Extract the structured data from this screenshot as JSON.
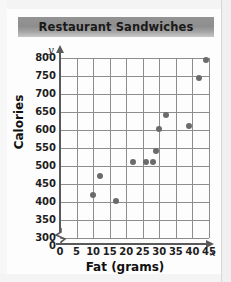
{
  "chart_data": {
    "type": "scatter",
    "title": "Restaurant Sandwiches",
    "xlabel": "Fat (grams)",
    "ylabel": "Calories",
    "x_var": "x",
    "y_var": "y",
    "xlim": [
      0,
      45
    ],
    "ylim": [
      300,
      800
    ],
    "xticks": [
      0,
      5,
      10,
      15,
      20,
      25,
      30,
      35,
      40,
      45
    ],
    "yticks": [
      300,
      350,
      400,
      450,
      500,
      550,
      600,
      650,
      700,
      750,
      800
    ],
    "y_axis_break": true,
    "y_axis_break_label": "0",
    "grid": true,
    "legend": null,
    "point_color": "#6b6b6b",
    "grid_color": "#8d8d8d",
    "axis_color": "#5a5a5a",
    "banner_color": "#949494",
    "points": [
      {
        "x": 10,
        "y": 420
      },
      {
        "x": 12,
        "y": 472
      },
      {
        "x": 17,
        "y": 402
      },
      {
        "x": 22,
        "y": 512
      },
      {
        "x": 26,
        "y": 512
      },
      {
        "x": 28,
        "y": 512
      },
      {
        "x": 29,
        "y": 542
      },
      {
        "x": 30,
        "y": 602
      },
      {
        "x": 32,
        "y": 643
      },
      {
        "x": 39,
        "y": 612
      },
      {
        "x": 42,
        "y": 745
      },
      {
        "x": 44,
        "y": 795
      }
    ]
  }
}
